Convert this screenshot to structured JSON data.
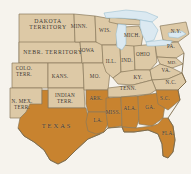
{
  "map": {
    "title": "United States 1861 — Union and Confederate States",
    "background_color": "#f6f3ed",
    "colors": {
      "union": "#ddc9a6",
      "confederate": "#c8832f",
      "lake": "#d9e8f0",
      "border": "#8a7a5c",
      "label_text": "#3b3123"
    },
    "legend": {
      "union_label": "Union states and territories",
      "confederate_label": "Confederate states"
    },
    "regions": [
      {
        "id": "dakota-territory",
        "label": "DAKOTA\nTERRITORY",
        "side": "union",
        "x": 48,
        "y": 24,
        "style": "big"
      },
      {
        "id": "nebraska-territory",
        "label": "NEBR. TERRITORY",
        "side": "union",
        "x": 53,
        "y": 52,
        "style": "big"
      },
      {
        "id": "colorado-territory",
        "label": "COLO.\nTERR.",
        "side": "union",
        "x": 24,
        "y": 72,
        "style": ""
      },
      {
        "id": "new-mexico-territory",
        "label": "N. MEX.\nTERR.",
        "side": "union",
        "x": 22,
        "y": 105,
        "style": ""
      },
      {
        "id": "indian-territory",
        "label": "INDIAN\nTERR.",
        "side": "union",
        "x": 65,
        "y": 99,
        "style": ""
      },
      {
        "id": "kansas",
        "label": "KANS.",
        "side": "union",
        "x": 60,
        "y": 77,
        "style": ""
      },
      {
        "id": "minnesota",
        "label": "MINN.",
        "side": "union",
        "x": 79,
        "y": 27,
        "style": ""
      },
      {
        "id": "iowa",
        "label": "IOWA",
        "side": "union",
        "x": 87,
        "y": 51,
        "style": ""
      },
      {
        "id": "missouri",
        "label": "MO.",
        "side": "union",
        "x": 95,
        "y": 77,
        "style": ""
      },
      {
        "id": "arkansas",
        "label": "ARK.",
        "side": "confederate",
        "x": 96,
        "y": 99,
        "style": ""
      },
      {
        "id": "wisconsin",
        "label": "WIS.",
        "side": "union",
        "x": 105,
        "y": 31,
        "style": ""
      },
      {
        "id": "illinois",
        "label": "ILL.",
        "side": "union",
        "x": 111,
        "y": 62,
        "style": ""
      },
      {
        "id": "michigan",
        "label": "MICH.",
        "side": "union",
        "x": 132,
        "y": 36,
        "style": ""
      },
      {
        "id": "indiana",
        "label": "IND.",
        "side": "union",
        "x": 127,
        "y": 61,
        "style": ""
      },
      {
        "id": "ohio",
        "label": "OHIO",
        "side": "union",
        "x": 143,
        "y": 55,
        "style": ""
      },
      {
        "id": "kentucky",
        "label": "KY.",
        "side": "union",
        "x": 138,
        "y": 78,
        "style": ""
      },
      {
        "id": "tennessee",
        "label": "TENN.",
        "side": "confederate",
        "x": 128,
        "y": 89,
        "style": ""
      },
      {
        "id": "new-york",
        "label": "N.Y.",
        "side": "union",
        "x": 176,
        "y": 32,
        "style": ""
      },
      {
        "id": "pennsylvania",
        "label": "PA.",
        "side": "union",
        "x": 171,
        "y": 47,
        "style": ""
      },
      {
        "id": "maryland",
        "label": "MD.",
        "side": "union",
        "x": 172,
        "y": 63,
        "style": "tiny"
      },
      {
        "id": "virginia",
        "label": "VA.",
        "side": "union",
        "x": 166,
        "y": 71,
        "style": ""
      },
      {
        "id": "north-carolina",
        "label": "N.C.",
        "side": "union",
        "x": 171,
        "y": 83,
        "style": ""
      },
      {
        "id": "south-carolina",
        "label": "S.C.",
        "side": "confederate",
        "x": 165,
        "y": 99,
        "style": ""
      },
      {
        "id": "georgia",
        "label": "GA.",
        "side": "confederate",
        "x": 150,
        "y": 108,
        "style": ""
      },
      {
        "id": "alabama",
        "label": "ALA.",
        "side": "confederate",
        "x": 130,
        "y": 109,
        "style": ""
      },
      {
        "id": "mississippi",
        "label": "MISS.",
        "side": "confederate",
        "x": 113,
        "y": 113,
        "style": ""
      },
      {
        "id": "louisiana",
        "label": "LA.",
        "side": "confederate",
        "x": 98,
        "y": 121,
        "style": ""
      },
      {
        "id": "florida",
        "label": "FLA.",
        "side": "confederate",
        "x": 168,
        "y": 134,
        "style": ""
      },
      {
        "id": "texas",
        "label": "TEXAS",
        "side": "confederate",
        "x": 57,
        "y": 126,
        "style": "texas"
      }
    ],
    "water_features": [
      {
        "id": "lake-superior",
        "label": ""
      },
      {
        "id": "lake-michigan",
        "label": ""
      },
      {
        "id": "lake-huron",
        "label": ""
      },
      {
        "id": "lake-erie",
        "label": ""
      },
      {
        "id": "lake-ontario",
        "label": ""
      }
    ]
  }
}
